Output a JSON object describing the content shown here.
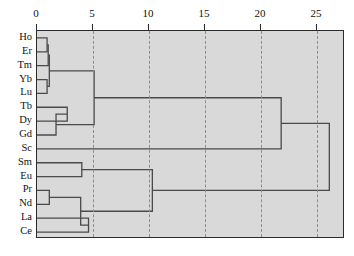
{
  "chart_data": {
    "type": "dendrogram",
    "title": "",
    "xlabel": "",
    "ylabel": "",
    "orientation": "horizontal",
    "axis_position": "top",
    "xlim": [
      0,
      27.5
    ],
    "grid": true,
    "grid_style": "dashed",
    "plot_background": "#d9d9d9",
    "line_color": "#4a4a4a",
    "border_color": "#2b2b2b",
    "ticks": [
      {
        "value": 0,
        "label": "0"
      },
      {
        "value": 5,
        "label": "5"
      },
      {
        "value": 10,
        "label": "10"
      },
      {
        "value": 15,
        "label": "15"
      },
      {
        "value": 20,
        "label": "20"
      },
      {
        "value": 25,
        "label": "25"
      }
    ],
    "leaves": [
      {
        "label": "Ho",
        "order": 0
      },
      {
        "label": "Er",
        "order": 1
      },
      {
        "label": "Tm",
        "order": 2
      },
      {
        "label": "Yb",
        "order": 3
      },
      {
        "label": "Lu",
        "order": 4
      },
      {
        "label": "Tb",
        "order": 5
      },
      {
        "label": "Dy",
        "order": 6
      },
      {
        "label": "Gd",
        "order": 7
      },
      {
        "label": "Sc",
        "order": 8
      },
      {
        "label": "Sm",
        "order": 9
      },
      {
        "label": "Eu",
        "order": 10
      },
      {
        "label": "Pr",
        "order": 11
      },
      {
        "label": "Nd",
        "order": 12
      },
      {
        "label": "La",
        "order": 13
      },
      {
        "label": "Ce",
        "order": 14
      }
    ],
    "merges": [
      {
        "id": "m1",
        "left": "Ho",
        "right": "Er",
        "height": 0.9
      },
      {
        "id": "m2",
        "left": "m1",
        "right": "Tm",
        "height": 1.0
      },
      {
        "id": "m3",
        "left": "Yb",
        "right": "Lu",
        "height": 0.9
      },
      {
        "id": "m4",
        "left": "m2",
        "right": "m3",
        "height": 1.1
      },
      {
        "id": "m5",
        "left": "Tb",
        "right": "Dy",
        "height": 2.7
      },
      {
        "id": "m6",
        "left": "m5",
        "right": "Gd",
        "height": 1.7
      },
      {
        "id": "m7",
        "left": "m4",
        "right": "m6",
        "height": 5.1
      },
      {
        "id": "m8",
        "left": "Pr",
        "right": "Nd",
        "height": 1.1
      },
      {
        "id": "m9",
        "left": "La",
        "right": "Ce",
        "height": 4.6
      },
      {
        "id": "m10",
        "left": "m8",
        "right": "m9",
        "height": 3.9
      },
      {
        "id": "m11",
        "left": "Sm",
        "right": "Eu",
        "height": 4.0
      },
      {
        "id": "m12",
        "left": "m11",
        "right": "m10",
        "height": 10.3
      },
      {
        "id": "m13",
        "left": "m7",
        "right": "Sc",
        "height": 21.8
      },
      {
        "id": "m14",
        "left": "m13",
        "right": "m12",
        "height": 26.1
      }
    ],
    "clusters": [
      {
        "name": "heavy-REE-plus-Sc",
        "members": [
          "Ho",
          "Er",
          "Tm",
          "Yb",
          "Lu",
          "Tb",
          "Dy",
          "Gd",
          "Sc"
        ]
      },
      {
        "name": "light-REE",
        "members": [
          "Sm",
          "Eu",
          "Pr",
          "Nd",
          "La",
          "Ce"
        ]
      }
    ]
  }
}
